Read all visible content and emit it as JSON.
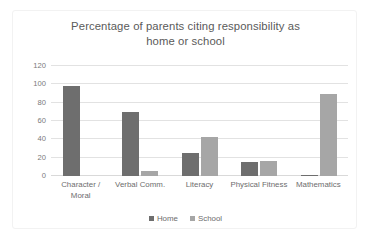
{
  "chart_data": {
    "type": "bar",
    "title": "Percentage of parents citing responsibility as home or school",
    "title_lines": [
      "Percentage of parents citing responsibility as",
      "home or school"
    ],
    "categories": [
      "Character / Moral",
      "Verbal Comm.",
      "Literacy",
      "Physical Fitness",
      "Mathematics"
    ],
    "category_lines": [
      [
        "Character /",
        "Moral"
      ],
      [
        "Verbal Comm."
      ],
      [
        "Literacy"
      ],
      [
        "Physical Fitness"
      ],
      [
        "Mathematics"
      ]
    ],
    "series": [
      {
        "name": "Home",
        "color": "#6E6E6E",
        "values": [
          98,
          70,
          25,
          15,
          1
        ]
      },
      {
        "name": "School",
        "color": "#A6A6A6",
        "values": [
          0,
          5,
          43,
          16,
          89
        ]
      }
    ],
    "xlabel": "",
    "ylabel": "",
    "ylim": [
      0,
      120
    ],
    "yticks": [
      0,
      20,
      40,
      60,
      80,
      100,
      120
    ],
    "ytick_labels": [
      "0",
      "20",
      "40",
      "60",
      "80",
      "100",
      "120"
    ],
    "grid": true,
    "legend_position": "bottom",
    "legend_entries": [
      "Home",
      "School"
    ]
  }
}
